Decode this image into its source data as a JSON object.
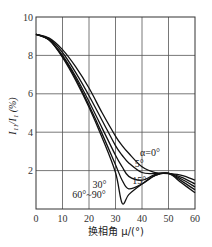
{
  "chart_data": {
    "type": "line",
    "title": "",
    "xlabel": "换相角 μ/(°)",
    "ylabel": "I₁₁/I₁ (%)",
    "xlim": [
      0,
      60
    ],
    "ylim": [
      0,
      10
    ],
    "xticks": [
      0,
      10,
      20,
      30,
      40,
      50,
      60
    ],
    "yticks": [
      2,
      4,
      6,
      8,
      10
    ],
    "grid": true,
    "legend": "inline labels",
    "x": [
      0,
      5,
      10,
      15,
      20,
      25,
      30,
      32.5,
      35,
      40,
      45,
      50,
      55,
      60
    ],
    "series": [
      {
        "name": "α=0°",
        "values": [
          9.1,
          8.9,
          8.3,
          7.4,
          6.3,
          5.0,
          3.8,
          3.3,
          2.9,
          2.2,
          1.9,
          1.85,
          1.75,
          1.5
        ]
      },
      {
        "name": "5°",
        "values": [
          9.1,
          8.85,
          8.15,
          7.1,
          5.9,
          4.6,
          3.3,
          2.8,
          2.4,
          1.9,
          1.85,
          1.85,
          1.65,
          1.3
        ]
      },
      {
        "name": "15°",
        "values": [
          9.1,
          8.8,
          8.0,
          6.9,
          5.6,
          4.2,
          2.8,
          2.2,
          1.7,
          1.5,
          1.8,
          1.85,
          1.55,
          1.15
        ]
      },
      {
        "name": "30°",
        "values": [
          9.1,
          8.8,
          7.95,
          6.8,
          5.4,
          3.9,
          2.3,
          1.5,
          1.05,
          1.3,
          1.75,
          1.85,
          1.45,
          1.0
        ]
      },
      {
        "name": "60°~90°",
        "values": [
          9.1,
          8.8,
          7.9,
          6.7,
          5.3,
          3.7,
          1.9,
          0.3,
          0.75,
          1.3,
          1.75,
          1.85,
          1.35,
          0.85
        ]
      }
    ],
    "annotations": [
      {
        "text": "α=0°",
        "x": 43,
        "y": 2.75
      },
      {
        "text": "5°",
        "x": 39,
        "y": 2.2
      },
      {
        "text": "15°",
        "x": 39,
        "y": 1.3
      },
      {
        "text": "30°",
        "x": 24,
        "y": 1.1
      },
      {
        "text": "60°~90°",
        "x": 20,
        "y": 0.55
      }
    ]
  },
  "axes": {
    "y_label_main": "I",
    "y_label_sub1": "11",
    "y_label_mid": "/I",
    "y_label_sub2": "1",
    "y_label_unit": "(%)",
    "x_label": "换相角 μ/(°)"
  }
}
